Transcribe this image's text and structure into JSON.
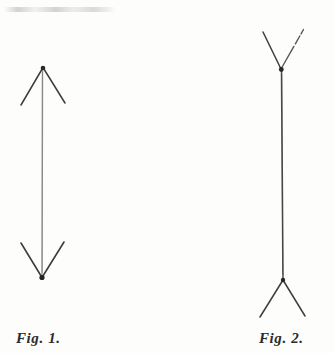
{
  "plate": {
    "background_color": "#fdfdfc",
    "ink_color": "#3a3a3a",
    "shaft_color_fig1": "#8a8a8a",
    "shaft_color_fig2": "#4a4a4a",
    "width": 334,
    "height": 353,
    "description": "Muller-Lyer illusion plate: two equal vertical lines with opposing arrowheads"
  },
  "figures": [
    {
      "id": "fig1",
      "caption": "Fig. 1.",
      "arrowhead_direction": "outward",
      "shaft": {
        "x": 42,
        "y_top": 67,
        "y_bottom": 278,
        "length": 211
      },
      "top_vertex": {
        "x": 43,
        "y": 67
      },
      "bottom_vertex": {
        "x": 42,
        "y": 278
      },
      "fins": [
        {
          "name": "top-left-fin",
          "x1": 43,
          "y1": 67,
          "x2": 21,
          "y2": 105
        },
        {
          "name": "top-right-fin",
          "x1": 43,
          "y1": 67,
          "x2": 65,
          "y2": 103
        },
        {
          "name": "bottom-left-fin",
          "x1": 42,
          "y1": 278,
          "x2": 21,
          "y2": 243
        },
        {
          "name": "bottom-right-fin",
          "x1": 42,
          "y1": 278,
          "x2": 64,
          "y2": 242
        }
      ]
    },
    {
      "id": "fig2",
      "caption": "Fig. 2.",
      "arrowhead_direction": "inward",
      "shaft": {
        "x": 282,
        "y_top": 69,
        "y_bottom": 280,
        "length": 211
      },
      "top_vertex": {
        "x": 281,
        "y": 69
      },
      "bottom_vertex": {
        "x": 283,
        "y": 280
      },
      "fins": [
        {
          "name": "top-left-fin",
          "x1": 281,
          "y1": 69,
          "x2": 263,
          "y2": 32
        },
        {
          "name": "top-right-fin",
          "x1": 281,
          "y1": 69,
          "x2": 302,
          "y2": 30
        },
        {
          "name": "bottom-left-fin",
          "x1": 283,
          "y1": 280,
          "x2": 260,
          "y2": 317
        },
        {
          "name": "bottom-right-fin",
          "x1": 283,
          "y1": 280,
          "x2": 305,
          "y2": 316
        }
      ]
    }
  ],
  "captions": {
    "fig1": "Fig. 1.",
    "fig2": "Fig. 2."
  }
}
